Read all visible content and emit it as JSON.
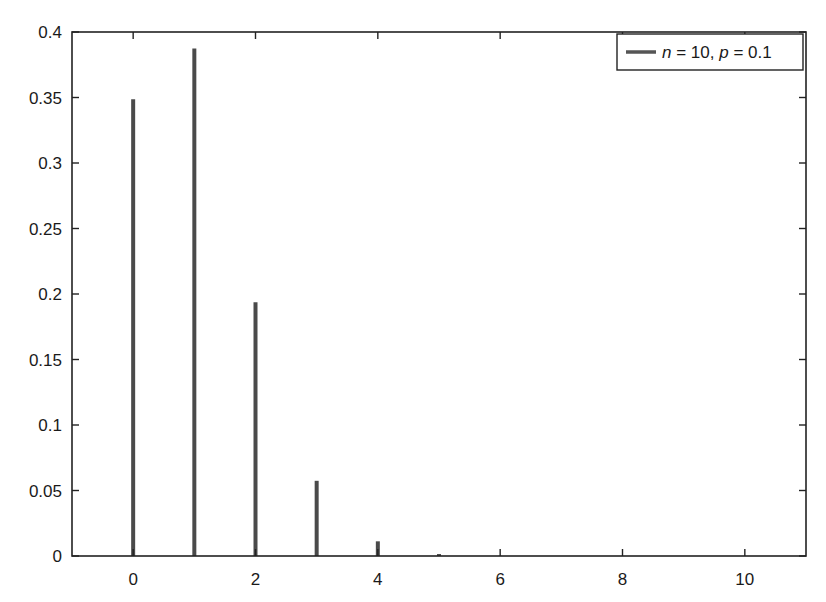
{
  "chart_data": {
    "type": "bar",
    "subtype": "stem",
    "title": "",
    "xlabel": "",
    "ylabel": "",
    "x": [
      0,
      1,
      2,
      3,
      4,
      5,
      6,
      7,
      8,
      9,
      10
    ],
    "series": [
      {
        "name": "n = 10, p = 0.1",
        "values": [
          0.3487,
          0.3874,
          0.1937,
          0.0574,
          0.0112,
          0.0015,
          0.0001,
          0.0,
          0.0,
          0.0,
          0.0
        ],
        "color": "#4a4a4a"
      }
    ],
    "xlim": [
      -1,
      11
    ],
    "ylim": [
      0,
      0.4
    ],
    "xticks": [
      "0",
      "2",
      "4",
      "6",
      "8",
      "10"
    ],
    "yticks": [
      "0",
      "0.05",
      "0.1",
      "0.15",
      "0.2",
      "0.25",
      "0.3",
      "0.35",
      "0.4"
    ],
    "grid": false,
    "legend": {
      "position": "upper right",
      "entries": [
        "n = 10, p = 0.1"
      ]
    }
  },
  "legend": {
    "n_label": "n",
    "eq1": " = 10, ",
    "p_label": "p",
    "eq2": " = 0.1"
  }
}
